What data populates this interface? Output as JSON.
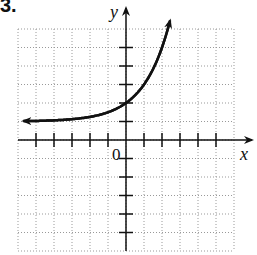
{
  "problem_number": "3.",
  "chart_data": {
    "type": "line",
    "title": "",
    "xlabel": "x",
    "ylabel": "y",
    "origin_label": "0",
    "xlim": [
      -6,
      6
    ],
    "ylim": [
      -6,
      6
    ],
    "grid": true,
    "grid_style": "dotted",
    "x_ticks": [
      -5,
      -4,
      -3,
      -2,
      -1,
      1,
      2,
      3,
      4,
      5
    ],
    "y_ticks": [
      -5,
      -4,
      -3,
      -2,
      -1,
      1,
      2,
      3,
      4,
      5
    ],
    "function": "y = 2^x + 1",
    "horizontal_asymptote": 1,
    "y_intercept": 2,
    "series": [
      {
        "name": "curve",
        "x": [
          -6,
          -4,
          -3,
          -2,
          -1,
          0,
          0.5,
          1,
          1.5,
          2,
          2.4
        ],
        "y": [
          1.02,
          1.06,
          1.13,
          1.25,
          1.5,
          2,
          2.41,
          3,
          3.83,
          5,
          6.0
        ]
      }
    ],
    "arrows": "both ends"
  }
}
